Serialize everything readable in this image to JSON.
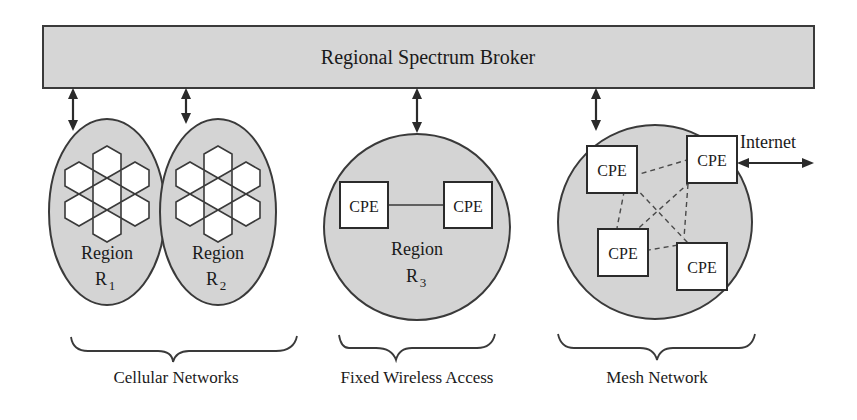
{
  "figure": {
    "background_color": "#ffffff",
    "shape_fill_color": "#d4d4d4",
    "stroke_color": "#3a3a3a",
    "text_color": "#1a1a1a"
  },
  "broker": {
    "label": "Regional Spectrum Broker"
  },
  "regions": [
    {
      "name": "Region",
      "subscript": "R",
      "sub_index": "1",
      "type": "cellular",
      "cell_count": 7
    },
    {
      "name": "Region",
      "subscript": "R",
      "sub_index": "2",
      "type": "cellular",
      "cell_count": 7
    },
    {
      "name": "Region",
      "subscript": "R",
      "sub_index": "3",
      "type": "fixed-wireless",
      "cell_count": 0
    }
  ],
  "nodes": {
    "cpe_label": "CPE",
    "fixed_wireless_cpe_count": 2,
    "mesh_cpe_count": 4
  },
  "internet": {
    "label": "Internet"
  },
  "groups": [
    {
      "label": "Cellular Networks"
    },
    {
      "label": "Fixed Wireless Access"
    },
    {
      "label": "Mesh Network"
    }
  ],
  "connectors": {
    "broker_link_count": 4,
    "broker_link_style": "double-headed-arrow",
    "mesh_link_style": "dashed",
    "fixed_wireless_link_style": "solid"
  }
}
